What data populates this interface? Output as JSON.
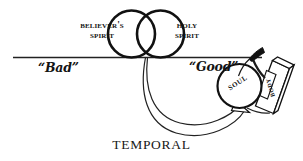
{
  "diagram": {
    "venn": {
      "left_circle": {
        "line1": "Believer's",
        "line2": "Spirit",
        "name": "believers-spirit"
      },
      "right_circle": {
        "line1": "Holy",
        "line2": "Spirit",
        "name": "holy-spirit"
      }
    },
    "axis": {
      "left_label": "“Bad”",
      "right_label": "“Good”",
      "bottom_label": "TEMPORAL"
    },
    "shapes": {
      "soul_label": "Soul",
      "body_label": "Body"
    },
    "colors": {
      "ink": "#111111",
      "background": "#ffffff",
      "line": "#222222"
    }
  }
}
